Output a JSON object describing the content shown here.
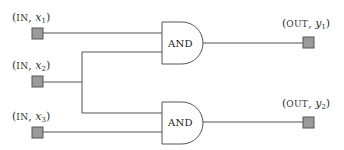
{
  "diagram": {
    "type": "logic-circuit",
    "colors": {
      "wire": "#555555",
      "port_fill": "#9a9a9a",
      "gate_fill": "#ffffff",
      "text": "#333333"
    },
    "inputs": [
      {
        "id": "x1",
        "kind": "IN",
        "var": "x",
        "sub": "1"
      },
      {
        "id": "x2",
        "kind": "IN",
        "var": "x",
        "sub": "2"
      },
      {
        "id": "x3",
        "kind": "IN",
        "var": "x",
        "sub": "3"
      }
    ],
    "outputs": [
      {
        "id": "y1",
        "kind": "OUT",
        "var": "y",
        "sub": "1"
      },
      {
        "id": "y2",
        "kind": "OUT",
        "var": "y",
        "sub": "2"
      }
    ],
    "gates": [
      {
        "id": "g1",
        "label": "AND",
        "inputs": [
          "x1",
          "x2"
        ],
        "output": "y1"
      },
      {
        "id": "g2",
        "label": "AND",
        "inputs": [
          "x2",
          "x3"
        ],
        "output": "y2"
      }
    ],
    "punct": {
      "open": "(",
      "sep": ", ",
      "close": ")"
    }
  }
}
